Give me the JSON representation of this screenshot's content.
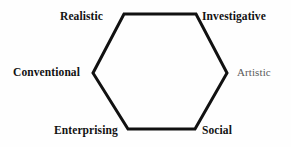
{
  "diagram": {
    "name": "Holland RIASEC hexagon",
    "shape": "hexagon",
    "stroke_color": "#111111",
    "stroke_width": 3,
    "background_color": "#fefefe",
    "vertices": [
      {
        "id": "realistic",
        "label": "Realistic",
        "position": "top-left",
        "x": 124,
        "y": 14,
        "emphasis": "bold"
      },
      {
        "id": "investigative",
        "label": "Investigative",
        "position": "top-right",
        "x": 196,
        "y": 14,
        "emphasis": "bold"
      },
      {
        "id": "artistic",
        "label": "Artistic",
        "position": "right",
        "x": 227,
        "y": 73,
        "emphasis": "faded"
      },
      {
        "id": "social",
        "label": "Social",
        "position": "bottom-right",
        "x": 195,
        "y": 129,
        "emphasis": "bold"
      },
      {
        "id": "enterprising",
        "label": "Enterprising",
        "position": "bottom-left",
        "x": 128,
        "y": 129,
        "emphasis": "bold"
      },
      {
        "id": "conventional",
        "label": "Conventional",
        "position": "left",
        "x": 93,
        "y": 73,
        "emphasis": "bold"
      }
    ]
  }
}
